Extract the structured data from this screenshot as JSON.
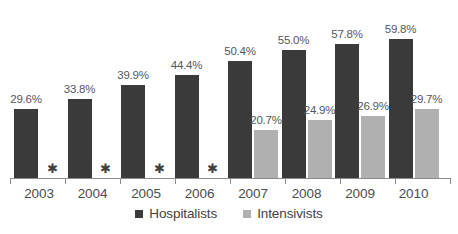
{
  "chart_data": {
    "type": "bar",
    "title": "",
    "xlabel": "",
    "ylabel": "",
    "ylim": [
      0,
      65
    ],
    "grid": false,
    "legend_position": "bottom",
    "categories": [
      "2003",
      "2004",
      "2005",
      "2006",
      "2007",
      "2008",
      "2009",
      "2010"
    ],
    "series": [
      {
        "name": "Hospitalists",
        "color": "#3a3a3a",
        "values": [
          29.6,
          33.8,
          39.9,
          44.4,
          50.4,
          55.0,
          57.8,
          59.8
        ],
        "labels": [
          "29.6%",
          "33.8%",
          "39.9%",
          "44.4%",
          "50.4%",
          "55.0%",
          "57.8%",
          "59.8%"
        ]
      },
      {
        "name": "Intensivists",
        "color": "#b0b0b0",
        "values": [
          null,
          null,
          null,
          null,
          20.7,
          24.9,
          26.9,
          29.7
        ],
        "labels": [
          "",
          "",
          "",
          "",
          "20.7%",
          "24.9%",
          "26.9%",
          "29.7%"
        ]
      }
    ],
    "missing_marker": "✱",
    "missing_marker_categories": [
      "2003",
      "2004",
      "2005",
      "2006"
    ],
    "annotations": []
  },
  "legend": {
    "items": [
      {
        "label": "Hospitalists",
        "color": "#3a3a3a"
      },
      {
        "label": "Intensivists",
        "color": "#b0b0b0"
      }
    ]
  },
  "colors": {
    "hospitalists": "#3a3a3a",
    "intensivists": "#b0b0b0",
    "axis": "#8d8d8d",
    "label_text": "#55565a",
    "category_text": "#4b4c50",
    "background": "#ffffff"
  }
}
